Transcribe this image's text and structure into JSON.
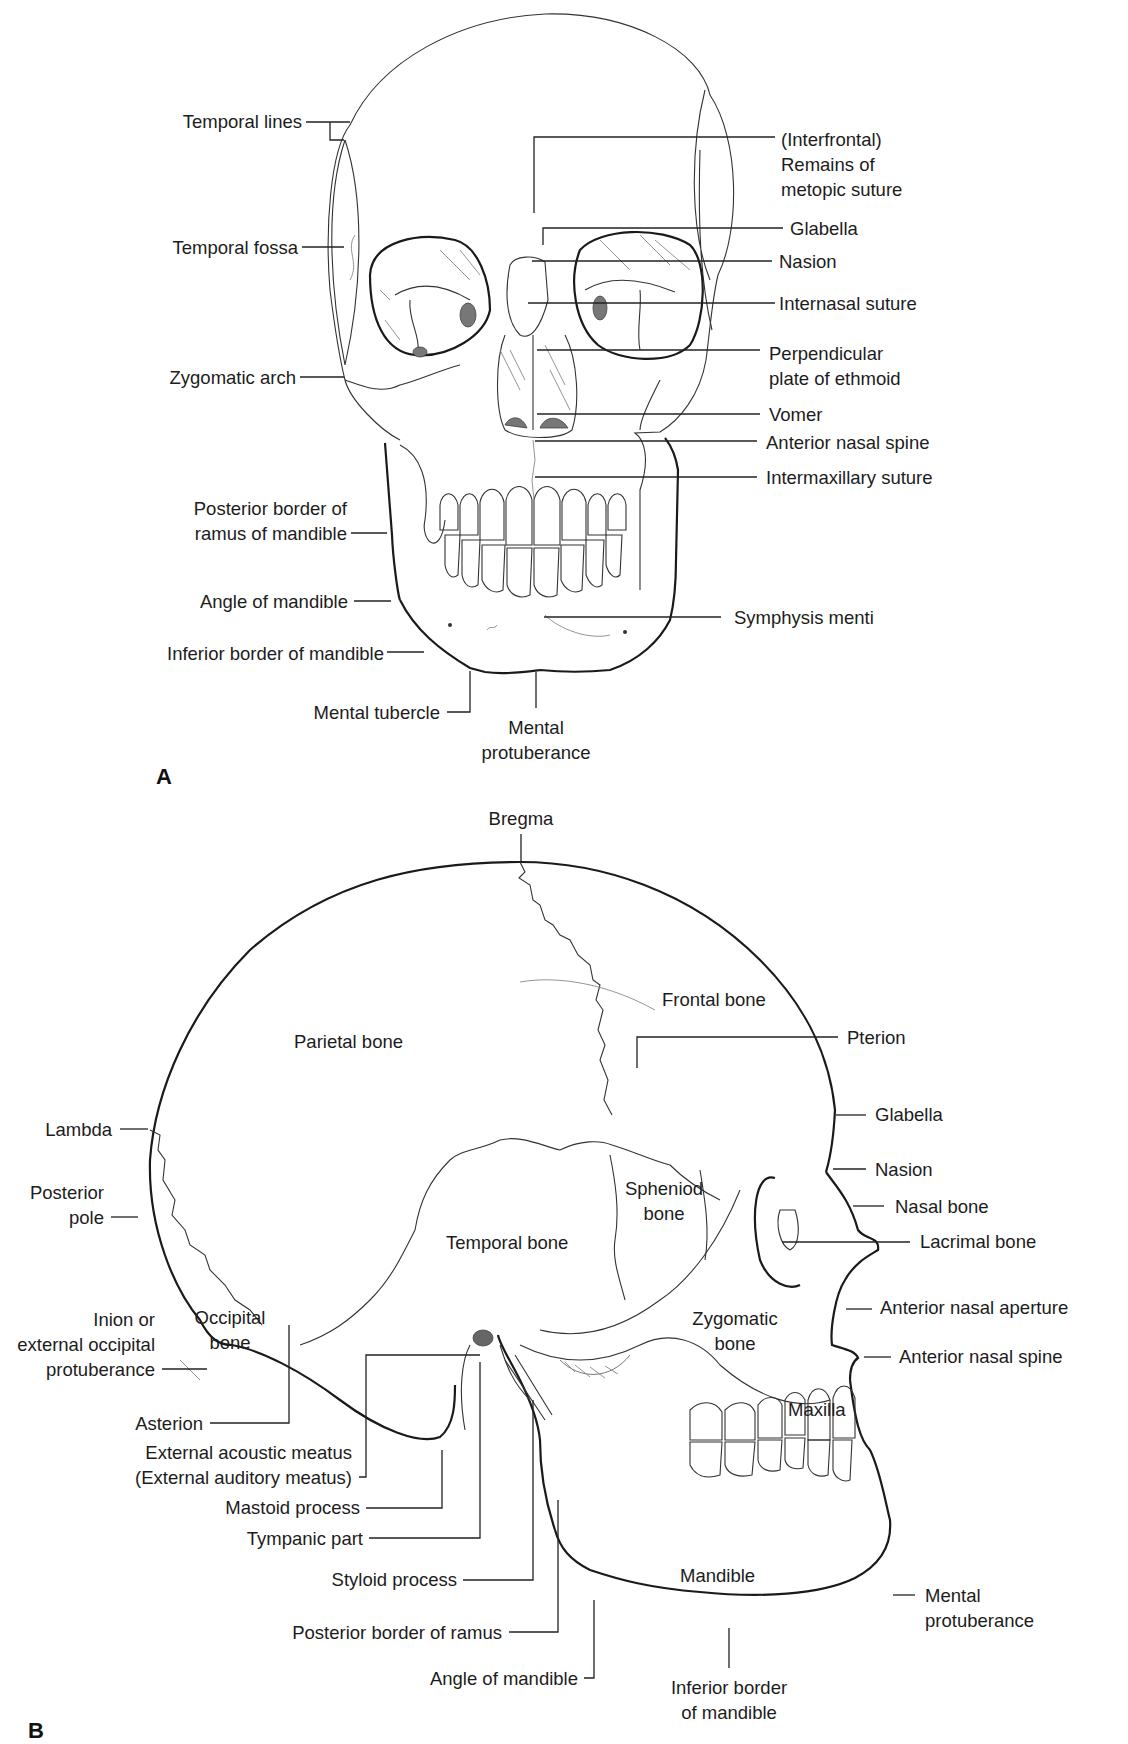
{
  "figure": {
    "panel_a": {
      "letter": "A",
      "view": "anterior view of skull",
      "labels_left": [
        "Temporal lines",
        "Temporal fossa",
        "Zygomatic arch",
        "Posterior border of",
        "ramus of mandible",
        "Angle of mandible",
        "Inferior border of mandible",
        "Mental tubercle"
      ],
      "labels_right": [
        "(Interfrontal)",
        "Remains of",
        "metopic suture",
        "Glabella",
        "Nasion",
        "Internasal suture",
        "Perpendicular",
        "plate of ethmoid",
        "Vomer",
        "Anterior nasal spine",
        "Intermaxillary suture",
        "Symphysis menti"
      ],
      "labels_bottom": [
        "Mental",
        "protuberance"
      ]
    },
    "panel_b": {
      "letter": "B",
      "view": "lateral view of skull",
      "top_label": "Bregma",
      "region_labels": [
        "Frontal bone",
        "Parietal bone",
        "Spheniod",
        "bone",
        "Temporal bone",
        "Occipital",
        "bone",
        "Zygomatic",
        "bone",
        "Maxilla",
        "Mandible"
      ],
      "labels_right": [
        "Pterion",
        "Glabella",
        "Nasion",
        "Nasal bone",
        "Lacrimal bone",
        "Anterior nasal aperture",
        "Anterior nasal spine",
        "Mental",
        "protuberance"
      ],
      "labels_left": [
        "Lambda",
        "Posterior",
        "pole",
        "Inion or",
        "external occipital",
        "protuberance",
        "Asterion",
        "External acoustic meatus",
        "(External auditory meatus)",
        "Mastoid process",
        "Tympanic part",
        "Styloid process",
        "Posterior border of ramus",
        "Angle of mandible"
      ],
      "labels_bottom": [
        "Inferior border",
        "of mandible"
      ]
    }
  }
}
